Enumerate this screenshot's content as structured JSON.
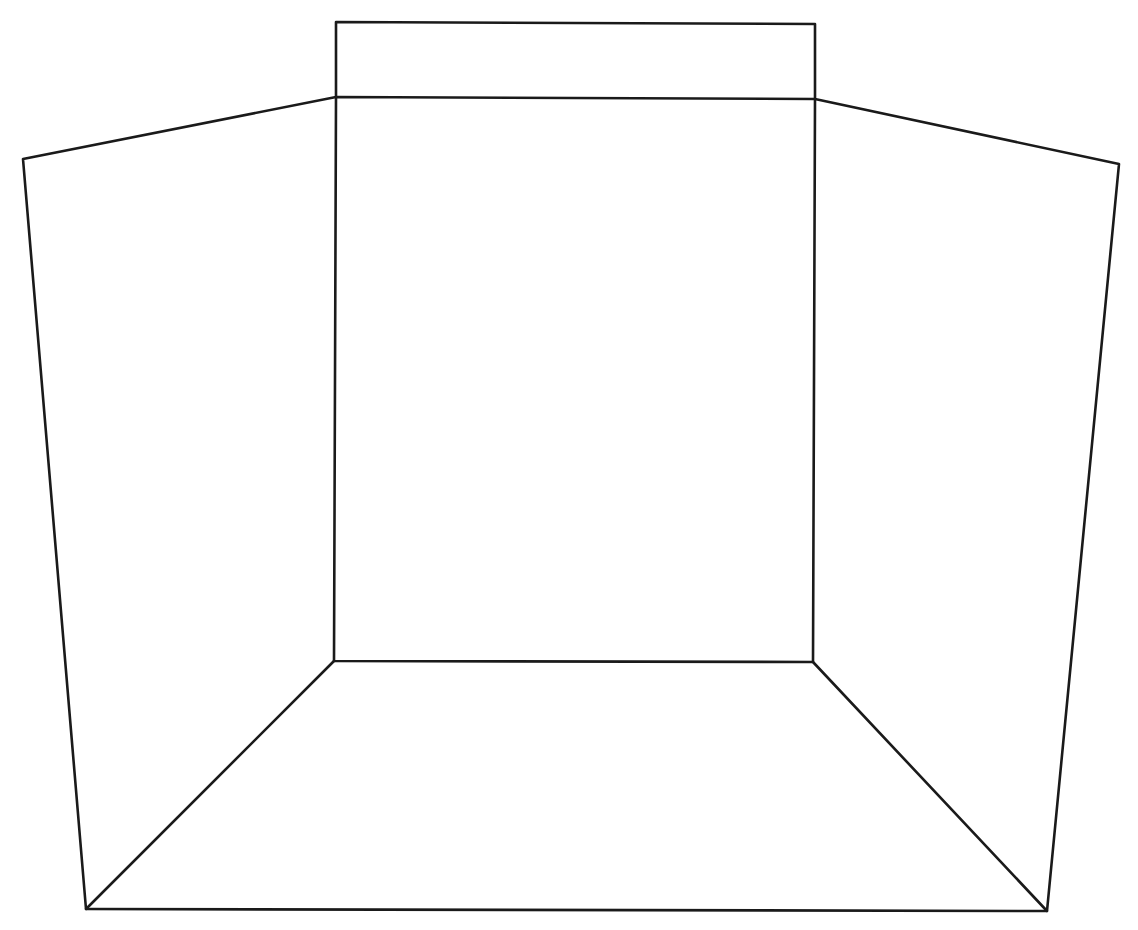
{
  "diagram": {
    "canvas": {
      "width": 1138,
      "height": 930,
      "background": "#ffffff"
    },
    "stroke": {
      "color": "#1a1a1a",
      "width": 2.6
    },
    "vertices": {
      "flap_top_left": [
        336,
        22
      ],
      "flap_top_right": [
        815,
        24
      ],
      "back_top_left": [
        336,
        97
      ],
      "back_top_right": [
        815,
        99
      ],
      "back_bottom_left": [
        334,
        661
      ],
      "back_bottom_right": [
        813,
        662
      ],
      "left_panel_outer_top": [
        23,
        159
      ],
      "right_panel_outer_top": [
        1119,
        164
      ],
      "floor_front_left": [
        86,
        909
      ],
      "floor_front_right": [
        1047,
        911
      ]
    },
    "shapes": [
      {
        "name": "top-flap",
        "points": [
          "back_top_left",
          "flap_top_left",
          "flap_top_right",
          "back_top_right"
        ],
        "closed": false
      },
      {
        "name": "back-panel",
        "points": [
          "back_top_left",
          "back_top_right",
          "back_bottom_right",
          "back_bottom_left"
        ],
        "closed": true
      },
      {
        "name": "left-panel",
        "points": [
          "back_top_left",
          "left_panel_outer_top",
          "floor_front_left",
          "back_bottom_left"
        ],
        "closed": false
      },
      {
        "name": "right-panel",
        "points": [
          "back_top_right",
          "right_panel_outer_top",
          "floor_front_right",
          "back_bottom_right"
        ],
        "closed": false
      },
      {
        "name": "floor-front-edge",
        "points": [
          "floor_front_left",
          "floor_front_right"
        ],
        "closed": false
      }
    ]
  }
}
